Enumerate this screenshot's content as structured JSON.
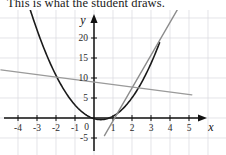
{
  "caption": {
    "text": "This is what the student draws."
  },
  "figure": {
    "name": "student-parabola-sketch"
  },
  "chart_data": {
    "type": "line",
    "title": "",
    "xlabel": "x",
    "ylabel": "y",
    "grid": true,
    "legend": "none",
    "xlim": [
      -4.9,
      6.0
    ],
    "ylim": [
      -8,
      28
    ],
    "x_ticks": [
      -4,
      -3,
      -2,
      -1,
      1,
      2,
      3,
      4,
      5
    ],
    "x_tick_labels": [
      "-4",
      "-3",
      "-2",
      "-1",
      "1",
      "2",
      "3",
      "4",
      "5"
    ],
    "y_ticks": [
      -5,
      5,
      10,
      15,
      20
    ],
    "y_tick_labels": [
      "-5",
      "5",
      "10",
      "15",
      "20"
    ],
    "origin_label": "0",
    "x_axis_label": "x",
    "y_axis_label": "y",
    "series": [
      {
        "name": "parabola",
        "kind": "quadratic",
        "color": "#1a1a1a",
        "width": 1.6,
        "equation_a": 2.0,
        "equation_h": 0.35,
        "equation_k": -0.4,
        "x_from": -3.6,
        "x_to": 3.45,
        "points_x": [
          -3.6,
          -3.0,
          -2.5,
          -2.0,
          -1.5,
          -1.0,
          -0.5,
          0.0,
          0.35,
          1.0,
          1.5,
          2.0,
          2.5,
          3.0,
          3.45
        ],
        "points_y": [
          30.8,
          21.9,
          16.0,
          10.7,
          6.4,
          3.2,
          1.0,
          -0.15,
          -0.4,
          0.45,
          2.2,
          4.9,
          8.8,
          13.6,
          18.9
        ]
      },
      {
        "name": "tangent-line-steep",
        "kind": "linear",
        "color": "#8c8c8c",
        "width": 1.4,
        "slope": 8.2,
        "intercept": -8.9,
        "x_from": 0.55,
        "x_to": 4.45
      },
      {
        "name": "shallow-line",
        "kind": "linear",
        "color": "#9a9a9a",
        "width": 1.3,
        "slope": -0.62,
        "intercept": 9.0,
        "x_from": -4.9,
        "x_to": 5.15
      }
    ]
  }
}
